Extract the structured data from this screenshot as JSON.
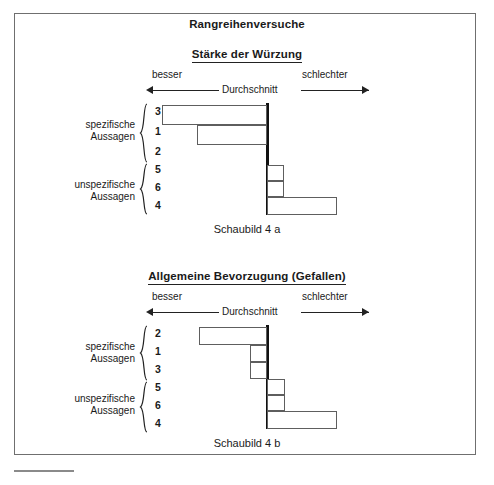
{
  "document": {
    "main_title": "Rangreihenversuche",
    "footer_rule": "horizontal-rule"
  },
  "charts": [
    {
      "title": "Stärke der Würzung",
      "caption": "Schaubild  4 a",
      "scale": {
        "left_label": "besser",
        "center_label": "Durchschnitt",
        "right_label": "schlechter"
      },
      "groups": [
        {
          "label_line1": "spezifische",
          "label_line2": "Aussagen",
          "ranks": [
            "3",
            "1",
            "2"
          ]
        },
        {
          "label_line1": "unspezifische",
          "label_line2": "Aussagen",
          "ranks": [
            "5",
            "6",
            "4"
          ]
        }
      ]
    },
    {
      "title": "Allgemeine Bevorzugung (Gefallen)",
      "caption": "Schaubild  4 b",
      "scale": {
        "left_label": "besser",
        "center_label": "Durchschnitt",
        "right_label": "schlechter"
      },
      "groups": [
        {
          "label_line1": "spezifische",
          "label_line2": "Aussagen",
          "ranks": [
            "2",
            "1",
            "3"
          ]
        },
        {
          "label_line1": "unspezifische",
          "label_line2": "Aussagen",
          "ranks": [
            "5",
            "6",
            "4"
          ]
        }
      ]
    }
  ],
  "chart_data": [
    {
      "type": "bar",
      "orientation": "horizontal-diverging",
      "title": "Stärke der Würzung",
      "subtitle": "Rangreihenversuche",
      "caption": "Schaubild  4 a",
      "xlabel": "Abweichung vom Durchschnitt",
      "ylabel": "",
      "axis_origin_label": "Durchschnitt",
      "axis_left_label": "besser",
      "axis_right_label": "schlechter",
      "grid": false,
      "legend": "none",
      "xlim": [
        -120,
        120
      ],
      "categories": [
        "3",
        "1",
        "2",
        "5",
        "6",
        "4"
      ],
      "category_groups": [
        "spezifische Aussagen",
        "spezifische Aussagen",
        "spezifische Aussagen",
        "unspezifische Aussagen",
        "unspezifische Aussagen",
        "unspezifische Aussagen"
      ],
      "values": [
        -104,
        -69,
        0,
        16,
        16,
        70
      ],
      "notes": "Negative values extend left (besser), positive right (schlechter); rank 2 has no visible bar."
    },
    {
      "type": "bar",
      "orientation": "horizontal-diverging",
      "title": "Allgemeine Bevorzugung (Gefallen)",
      "subtitle": "Rangreihenversuche",
      "caption": "Schaubild  4 b",
      "xlabel": "Abweichung vom Durchschnitt",
      "ylabel": "",
      "axis_origin_label": "Durchschnitt",
      "axis_left_label": "besser",
      "axis_right_label": "schlechter",
      "grid": false,
      "legend": "none",
      "xlim": [
        -120,
        120
      ],
      "categories": [
        "2",
        "1",
        "3",
        "5",
        "6",
        "4"
      ],
      "category_groups": [
        "spezifische Aussagen",
        "spezifische Aussagen",
        "spezifische Aussagen",
        "unspezifische Aussagen",
        "unspezifische Aussagen",
        "unspezifische Aussagen"
      ],
      "values": [
        -68,
        -17,
        -17,
        17,
        17,
        70
      ],
      "notes": "Negative values extend left (besser), positive right (schlechter)."
    }
  ],
  "geometry": {
    "axis_x": 266,
    "px_per_unit": 1,
    "charts": [
      {
        "top": 48,
        "plot_top": 110,
        "plot_height": 112,
        "caption_top": 226,
        "bars": [
          {
            "rank": "3",
            "left": 162,
            "width": 105,
            "top": 2,
            "height": 20
          },
          {
            "rank": "1",
            "left": 197,
            "width": 70,
            "top": 22,
            "height": 20
          },
          {
            "rank": "2",
            "left": 266,
            "width": 0,
            "top": 42,
            "height": 20
          },
          {
            "rank": "5",
            "left": 267,
            "width": 17,
            "top": 62,
            "height": 16
          },
          {
            "rank": "6",
            "left": 267,
            "width": 17,
            "top": 78,
            "height": 16
          },
          {
            "rank": "4",
            "left": 267,
            "width": 70,
            "top": 94,
            "height": 18
          }
        ],
        "groups": [
          {
            "label_top": 126,
            "brace_top": 110,
            "brace_height": 60,
            "ranks_top": [
              112,
              132,
              152
            ]
          },
          {
            "label_top": 186,
            "brace_top": 170,
            "brace_height": 52,
            "ranks_top": [
              170,
              188,
              206
            ]
          }
        ]
      },
      {
        "top": 270,
        "plot_top": 332,
        "plot_height": 104,
        "caption_top": 440,
        "bars": [
          {
            "rank": "2",
            "left": 199,
            "width": 68,
            "top": 2,
            "height": 18
          },
          {
            "rank": "1",
            "left": 250,
            "width": 17,
            "top": 20,
            "height": 17
          },
          {
            "rank": "3",
            "left": 250,
            "width": 17,
            "top": 37,
            "height": 17
          },
          {
            "rank": "5",
            "left": 267,
            "width": 18,
            "top": 54,
            "height": 16
          },
          {
            "rank": "6",
            "left": 267,
            "width": 18,
            "top": 70,
            "height": 16
          },
          {
            "rank": "4",
            "left": 267,
            "width": 70,
            "top": 86,
            "height": 18
          }
        ],
        "groups": [
          {
            "label_top": 348,
            "brace_top": 332,
            "brace_height": 56,
            "ranks_top": [
              334,
              352,
              370
            ]
          },
          {
            "label_top": 400,
            "brace_top": 388,
            "brace_height": 52,
            "ranks_top": [
              388,
              406,
              424
            ]
          }
        ]
      }
    ]
  }
}
